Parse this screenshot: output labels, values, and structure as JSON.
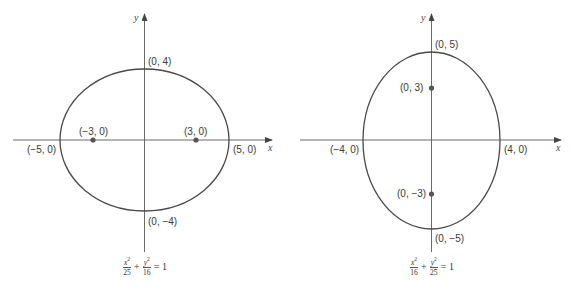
{
  "colors": {
    "curve": "#4a4a4a",
    "axis": "#5a5a5a",
    "point": "#555555",
    "text": "#3a3a3a"
  },
  "figures": [
    {
      "id": "left",
      "axis_label_x": "x",
      "axis_label_y": "y",
      "labels": {
        "top": "(0, 4)",
        "bottom": "(0, −4)",
        "left": "(−5, 0)",
        "right": "(5, 0)",
        "focus1": "(−3, 0)",
        "focus2": "(3, 0)"
      },
      "equation": {
        "term1_num": "x",
        "term1_den": "25",
        "term2_num": "y",
        "term2_den": "16",
        "exp": "2",
        "plus": "+",
        "equals": "= 1"
      }
    },
    {
      "id": "right",
      "axis_label_x": "x",
      "axis_label_y": "y",
      "labels": {
        "top": "(0, 5)",
        "bottom": "(0, −5)",
        "left": "(−4, 0)",
        "right": "(4, 0)",
        "focus1": "(0, 3)",
        "focus2": "(0, −3)"
      },
      "equation": {
        "term1_num": "x",
        "term1_den": "16",
        "term2_num": "y",
        "term2_den": "25",
        "exp": "2",
        "plus": "+",
        "equals": "= 1"
      }
    }
  ]
}
